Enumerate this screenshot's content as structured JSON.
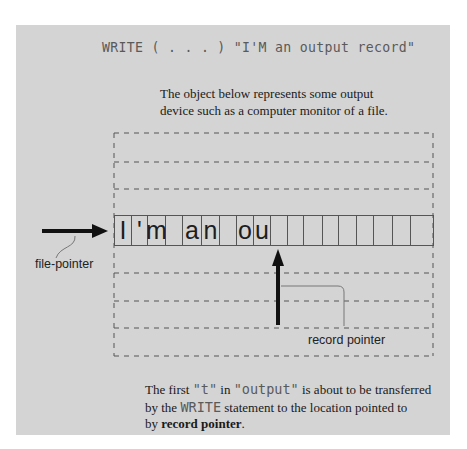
{
  "title": {
    "keyword": "WRITE",
    "args": "( . . . )",
    "string": "\"I'M an output record\""
  },
  "description": {
    "lines": [
      "The object below represents some output",
      "device such as a computer monitor of a file."
    ]
  },
  "device": {
    "record_cells": [
      "I",
      "'",
      "m",
      "",
      "a",
      "n",
      "",
      "o",
      "u",
      "",
      "",
      "",
      "",
      "",
      "",
      "",
      "",
      ""
    ],
    "dashed_lines_above": 3,
    "dashed_lines_below": 3
  },
  "labels": {
    "file_pointer": "file-pointer",
    "record_pointer": "record pointer"
  },
  "footer": {
    "line1_pre": "The first ",
    "line1_code1": "\"t\"",
    "line1_mid": " in ",
    "line1_code2": "\"output\"",
    "line1_post": " is about to be transferred",
    "line2_pre": "by the ",
    "line2_code": "WRITE",
    "line2_post": " statement to the location pointed to",
    "line3_pre": "by ",
    "line3_bold": "record pointer",
    "line3_post": "."
  },
  "colors": {
    "panel": "#d4d4d4",
    "ink": "#1a1a1a",
    "code": "#5a5a5a",
    "dash": "#555555"
  }
}
